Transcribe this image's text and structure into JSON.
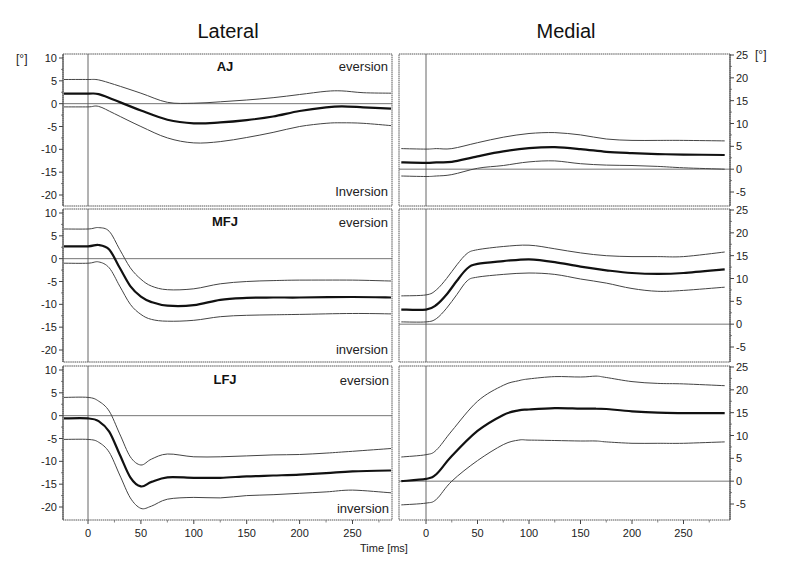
{
  "chart_data": {
    "type": "line",
    "title": "",
    "column_titles": [
      "Lateral",
      "Medial"
    ],
    "xlabel": "Time [ms]",
    "ylabel": "[°]",
    "xlim": [
      -24,
      290
    ],
    "xticks": [
      0,
      50,
      100,
      150,
      200,
      250
    ],
    "grid": false,
    "legend": null,
    "annotations": {
      "eversion": "eversion",
      "inversion": "inversion",
      "inversion_top": "Inversion"
    },
    "panels": [
      {
        "id": "lateral-aj",
        "side": "Lateral",
        "joint": "AJ",
        "ylim": [
          -22,
          11
        ],
        "yticks": [
          10,
          5,
          0,
          -5,
          -10,
          -15,
          -20
        ],
        "x": [
          -24,
          0,
          10,
          25,
          50,
          75,
          100,
          125,
          150,
          175,
          200,
          225,
          240,
          260,
          290
        ],
        "series": [
          {
            "name": "mean + SD",
            "values": [
              5.3,
              5.3,
              5.2,
              4.2,
              2.3,
              0.3,
              0.1,
              0.4,
              0.8,
              1.3,
              2.0,
              2.7,
              2.8,
              2.4,
              2.3
            ]
          },
          {
            "name": "mean",
            "values": [
              2.2,
              2.2,
              2.1,
              0.8,
              -1.5,
              -3.5,
              -4.3,
              -4.1,
              -3.6,
              -2.8,
              -1.6,
              -0.8,
              -0.6,
              -0.8,
              -1.1
            ]
          },
          {
            "name": "mean - SD",
            "values": [
              -0.7,
              -0.7,
              -0.6,
              -2.2,
              -5.0,
              -7.5,
              -8.6,
              -8.3,
              -7.4,
              -6.3,
              -5.0,
              -4.3,
              -4.2,
              -4.3,
              -4.8
            ]
          }
        ]
      },
      {
        "id": "medial-aj",
        "side": "Medial",
        "joint": "AJ",
        "ylim": [
          -8,
          26
        ],
        "yticks": [
          25,
          20,
          15,
          10,
          5,
          0,
          -5
        ],
        "x": [
          -24,
          0,
          10,
          25,
          50,
          75,
          100,
          125,
          150,
          175,
          200,
          225,
          250,
          290
        ],
        "series": [
          {
            "name": "mean + SD",
            "values": [
              4.5,
              4.4,
              4.5,
              4.5,
              5.8,
              7.0,
              7.8,
              8.0,
              7.5,
              6.6,
              6.3,
              6.3,
              6.3,
              6.2
            ]
          },
          {
            "name": "mean",
            "values": [
              1.5,
              1.4,
              1.5,
              1.6,
              2.8,
              3.9,
              4.6,
              4.8,
              4.4,
              3.8,
              3.5,
              3.3,
              3.2,
              3.1
            ]
          },
          {
            "name": "mean - SD",
            "values": [
              -1.5,
              -1.6,
              -1.5,
              -1.2,
              0.2,
              0.8,
              1.6,
              1.8,
              1.2,
              0.9,
              0.8,
              0.6,
              0.3,
              0.0
            ]
          }
        ]
      },
      {
        "id": "lateral-mfj",
        "side": "Lateral",
        "joint": "MFJ",
        "ylim": [
          -22,
          11
        ],
        "yticks": [
          10,
          5,
          0,
          -5,
          -10,
          -15,
          -20
        ],
        "x": [
          -24,
          0,
          10,
          20,
          30,
          40,
          50,
          60,
          75,
          100,
          125,
          150,
          175,
          200,
          250,
          290
        ],
        "series": [
          {
            "name": "mean + SD",
            "values": [
              6.5,
              6.5,
              6.8,
              6.0,
              2.0,
              -2.0,
              -4.5,
              -6.0,
              -6.8,
              -6.6,
              -5.5,
              -5.0,
              -4.8,
              -4.7,
              -4.7,
              -4.9
            ]
          },
          {
            "name": "mean",
            "values": [
              2.7,
              2.7,
              3.0,
              2.0,
              -2.0,
              -6.0,
              -8.3,
              -9.5,
              -10.3,
              -10.2,
              -9.0,
              -8.6,
              -8.5,
              -8.5,
              -8.4,
              -8.5
            ]
          },
          {
            "name": "mean - SD",
            "values": [
              -1.0,
              -1.0,
              -0.7,
              -2.0,
              -6.0,
              -10.0,
              -12.2,
              -13.3,
              -13.7,
              -13.5,
              -12.7,
              -12.4,
              -12.3,
              -12.2,
              -12.0,
              -12.1
            ]
          }
        ]
      },
      {
        "id": "medial-mfj",
        "side": "Medial",
        "joint": "MFJ",
        "ylim": [
          -8,
          26
        ],
        "yticks": [
          25,
          20,
          15,
          10,
          5,
          0,
          -5
        ],
        "x": [
          -24,
          0,
          10,
          20,
          30,
          40,
          50,
          75,
          100,
          125,
          150,
          175,
          200,
          225,
          250,
          290
        ],
        "series": [
          {
            "name": "mean + SD",
            "values": [
              6.2,
              6.4,
              7.5,
              10.0,
              13.0,
              15.5,
              16.3,
              17.0,
              17.3,
              16.5,
              15.6,
              15.0,
              14.8,
              14.8,
              14.8,
              15.8
            ]
          },
          {
            "name": "mean",
            "values": [
              3.2,
              3.2,
              4.2,
              6.5,
              9.5,
              12.2,
              13.2,
              13.8,
              14.2,
              13.6,
              12.6,
              11.8,
              11.2,
              11.0,
              11.2,
              12.0
            ]
          },
          {
            "name": "mean - SD",
            "values": [
              0.5,
              0.5,
              1.2,
              3.5,
              6.5,
              9.5,
              10.3,
              10.9,
              11.2,
              10.9,
              9.9,
              9.0,
              7.8,
              7.2,
              7.4,
              8.1
            ]
          }
        ]
      },
      {
        "id": "lateral-lfj",
        "side": "Lateral",
        "joint": "LFJ",
        "ylim": [
          -22,
          11
        ],
        "yticks": [
          10,
          5,
          0,
          -5,
          -10,
          -15,
          -20
        ],
        "x": [
          -24,
          0,
          10,
          20,
          30,
          40,
          50,
          60,
          75,
          100,
          125,
          150,
          175,
          200,
          225,
          250,
          290
        ],
        "series": [
          {
            "name": "mean + SD",
            "values": [
              4.0,
              4.0,
              3.2,
              1.0,
              -4.0,
              -9.0,
              -10.8,
              -9.5,
              -8.4,
              -9.0,
              -9.0,
              -8.8,
              -8.6,
              -8.5,
              -8.2,
              -7.8,
              -7.2
            ]
          },
          {
            "name": "mean",
            "values": [
              -0.6,
              -0.6,
              -1.2,
              -3.5,
              -8.5,
              -13.5,
              -15.5,
              -14.5,
              -13.5,
              -13.6,
              -13.6,
              -13.3,
              -13.1,
              -12.9,
              -12.6,
              -12.2,
              -12.0
            ]
          },
          {
            "name": "mean - SD",
            "values": [
              -5.2,
              -5.2,
              -5.8,
              -8.0,
              -13.0,
              -18.0,
              -20.3,
              -19.8,
              -18.3,
              -17.9,
              -18.0,
              -17.5,
              -17.3,
              -17.0,
              -16.7,
              -16.3,
              -16.9
            ]
          }
        ]
      },
      {
        "id": "medial-lfj",
        "side": "Medial",
        "joint": "LFJ",
        "ylim": [
          -8,
          26
        ],
        "yticks": [
          25,
          20,
          15,
          10,
          5,
          0,
          -5
        ],
        "x": [
          -24,
          0,
          10,
          25,
          50,
          75,
          90,
          100,
          125,
          150,
          165,
          175,
          200,
          225,
          250,
          290
        ],
        "series": [
          {
            "name": "mean + SD",
            "values": [
              5.3,
              5.8,
              6.8,
              11.0,
              17.5,
              21.0,
              22.0,
              22.4,
              22.9,
              22.8,
              23.0,
              22.7,
              21.8,
              21.4,
              21.3,
              20.9
            ]
          },
          {
            "name": "mean",
            "values": [
              0.0,
              0.5,
              1.5,
              5.5,
              11.0,
              14.5,
              15.5,
              15.7,
              16.0,
              15.9,
              15.9,
              15.8,
              15.3,
              15.0,
              14.9,
              14.9
            ]
          },
          {
            "name": "mean - SD",
            "values": [
              -5.2,
              -4.8,
              -4.0,
              0.0,
              4.5,
              8.0,
              9.0,
              9.0,
              8.9,
              8.8,
              8.8,
              8.6,
              8.3,
              8.3,
              8.3,
              8.6
            ]
          }
        ]
      }
    ]
  },
  "figure": {
    "column_titles": {
      "left": "Lateral",
      "right": "Medial"
    },
    "unit_label": "[°]",
    "x_axis_label": "Time [ms]",
    "eversion": "eversion",
    "inversion": "inversion",
    "inversion_cap": "Inversion",
    "joints": {
      "aj": "AJ",
      "mfj": "MFJ",
      "lfj": "LFJ"
    }
  }
}
